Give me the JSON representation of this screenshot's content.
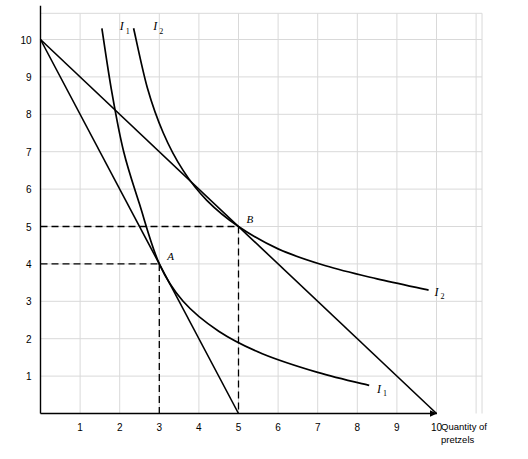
{
  "chart_data": {
    "type": "line",
    "title": "",
    "xlabel": "Quantity of pretzels",
    "ylabel": "",
    "xlim": [
      0,
      11
    ],
    "ylim": [
      0,
      10.7
    ],
    "grid": true,
    "x_ticks": [
      "1",
      "2",
      "3",
      "4",
      "5",
      "6",
      "7",
      "8",
      "9",
      "10"
    ],
    "y_ticks": [
      "1",
      "2",
      "3",
      "4",
      "5",
      "6",
      "7",
      "8",
      "9",
      "10"
    ],
    "series": [
      {
        "name": "Budget line 1",
        "type": "line",
        "points": [
          [
            0,
            10
          ],
          [
            5,
            0
          ]
        ]
      },
      {
        "name": "Budget line 2",
        "type": "line",
        "points": [
          [
            0,
            10
          ],
          [
            10,
            0
          ]
        ]
      },
      {
        "name": "I1",
        "type": "indifference-curve",
        "label": "I",
        "subscript": "1",
        "points": [
          [
            1.55,
            10.3
          ],
          [
            1.8,
            8.6
          ],
          [
            2.1,
            7.0
          ],
          [
            2.5,
            5.6
          ],
          [
            3.0,
            4.0
          ],
          [
            3.6,
            3.0
          ],
          [
            4.5,
            2.2
          ],
          [
            5.6,
            1.6
          ],
          [
            7.0,
            1.1
          ],
          [
            8.3,
            0.75
          ]
        ]
      },
      {
        "name": "I2",
        "type": "indifference-curve",
        "label": "I",
        "subscript": "2",
        "points": [
          [
            2.35,
            10.3
          ],
          [
            2.7,
            8.7
          ],
          [
            3.1,
            7.5
          ],
          [
            3.6,
            6.5
          ],
          [
            4.2,
            5.7
          ],
          [
            5.0,
            5.0
          ],
          [
            6.0,
            4.4
          ],
          [
            7.2,
            3.95
          ],
          [
            8.5,
            3.6
          ],
          [
            9.8,
            3.3
          ]
        ]
      }
    ],
    "points_of_interest": [
      {
        "label": "A",
        "x": 3,
        "y": 4,
        "dashed": true
      },
      {
        "label": "B",
        "x": 5,
        "y": 5,
        "dashed": true
      }
    ],
    "curve_labels": [
      {
        "label": "I",
        "sub": "1",
        "x": 2.0,
        "y": 10.25
      },
      {
        "label": "I",
        "sub": "2",
        "x": 2.85,
        "y": 10.25
      },
      {
        "label": "I",
        "sub": "1",
        "x": 8.5,
        "y": 0.55
      },
      {
        "label": "I",
        "sub": "2",
        "x": 9.95,
        "y": 3.15
      }
    ]
  }
}
